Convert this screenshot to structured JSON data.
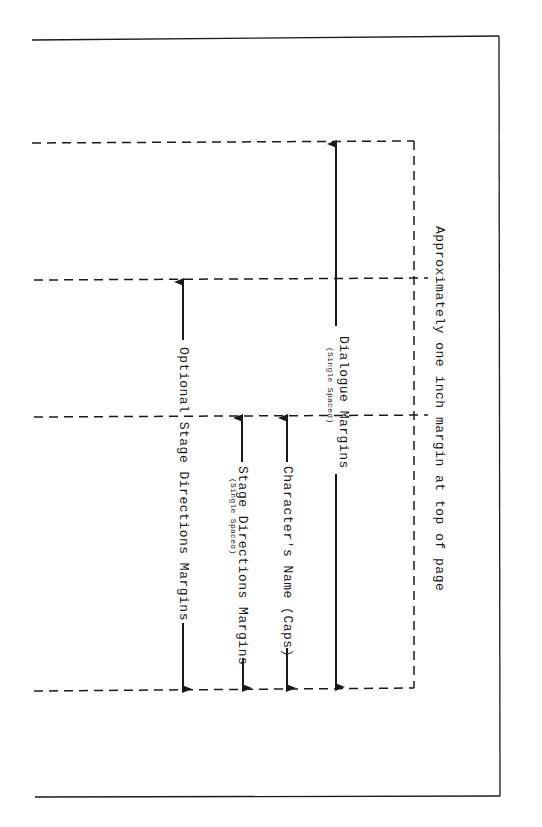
{
  "diagram": {
    "labels": {
      "top_margin": "Approximately one inch margin at top of page",
      "dialogue": "Dialogue Margins",
      "dialogue_note": "(Single Spaced)",
      "character_name": "Character's Name (Caps)",
      "stage_directions": "Stage Directions Margins",
      "stage_directions_note": "(Single Spaced)",
      "optional_stage_directions": "Optional Stage Directions Margins"
    },
    "colors": {
      "line": "#1a1a1a",
      "background": "#ffffff"
    }
  }
}
